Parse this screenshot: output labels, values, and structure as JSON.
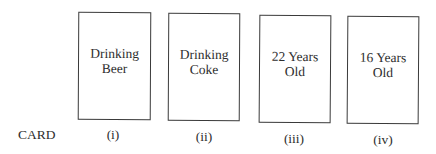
{
  "row_label": "CARD",
  "cards": [
    {
      "text": "Drinking\nBeer",
      "numeral": "(i)"
    },
    {
      "text": "Drinking\nCoke",
      "numeral": "(ii)"
    },
    {
      "text": "22 Years\nOld",
      "numeral": "(iii)"
    },
    {
      "text": "16 Years\nOld",
      "numeral": "(iv)"
    }
  ],
  "colors": {
    "background": "#ffffff",
    "border": "#3a3a3a",
    "text": "#2e2e2e"
  }
}
